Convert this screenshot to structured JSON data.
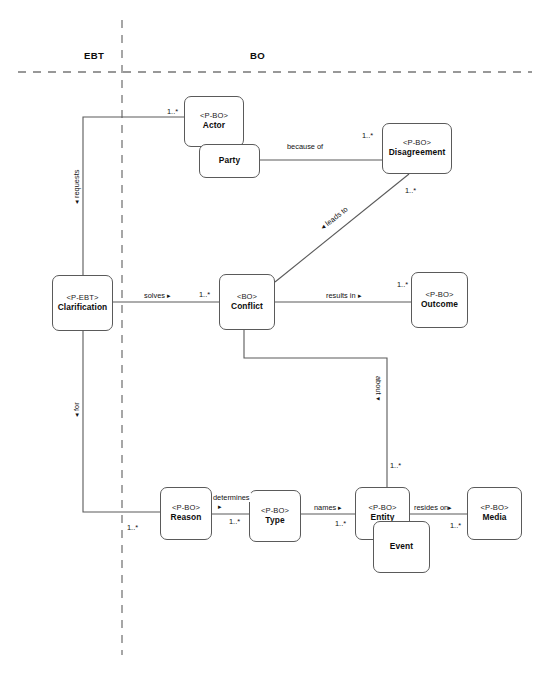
{
  "diagram": {
    "zones": [
      {
        "id": "ebt",
        "label": "EBT",
        "x": 84,
        "y": 50
      },
      {
        "id": "bo",
        "label": "BO",
        "x": 250,
        "y": 50
      }
    ],
    "dividers": [
      {
        "id": "vertical-divider",
        "orientation": "vertical",
        "x": 122,
        "y1": 20,
        "y2": 655
      },
      {
        "id": "horizontal-divider",
        "orientation": "horizontal",
        "y": 72,
        "x1": 18,
        "x2": 532
      }
    ],
    "nodes": [
      {
        "id": "actor",
        "stereotype": "<P-BO>",
        "name": "Actor",
        "x": 184,
        "y": 96,
        "w": 60,
        "h": 51
      },
      {
        "id": "party",
        "stereotype": "",
        "name": "Party",
        "x": 199,
        "y": 144,
        "w": 61,
        "h": 34
      },
      {
        "id": "disagreement",
        "stereotype": "<P-BO>",
        "name": "Disagreement",
        "x": 382,
        "y": 123,
        "w": 70,
        "h": 51
      },
      {
        "id": "clarification",
        "stereotype": "<P-EBT>",
        "name": "Clarification",
        "x": 52,
        "y": 275,
        "w": 61,
        "h": 56
      },
      {
        "id": "conflict",
        "stereotype": "<BO>",
        "name": "Conflict",
        "x": 219,
        "y": 274,
        "w": 56,
        "h": 56
      },
      {
        "id": "outcome",
        "stereotype": "<P-BO>",
        "name": "Outcome",
        "x": 411,
        "y": 272,
        "w": 57,
        "h": 56
      },
      {
        "id": "reason",
        "stereotype": "<P-BO>",
        "name": "Reason",
        "x": 160,
        "y": 487,
        "w": 52,
        "h": 53
      },
      {
        "id": "type",
        "stereotype": "<P-BO>",
        "name": "Type",
        "x": 249,
        "y": 490,
        "w": 52,
        "h": 52
      },
      {
        "id": "entity",
        "stereotype": "<P-BO>",
        "name": "Entity",
        "x": 355,
        "y": 487,
        "w": 55,
        "h": 53
      },
      {
        "id": "event",
        "stereotype": "",
        "name": "Event",
        "x": 373,
        "y": 521,
        "w": 57,
        "h": 52
      },
      {
        "id": "media",
        "stereotype": "<P-BO>",
        "name": "Media",
        "x": 467,
        "y": 487,
        "w": 55,
        "h": 53
      }
    ],
    "edges": [
      {
        "id": "clarification-requests-actor",
        "from": "clarification",
        "to": "actor",
        "path": "M 184 117 L 83 117 L 83 275"
      },
      {
        "id": "actor-because-of-disagreement",
        "from": "party",
        "to": "disagreement",
        "path": "M 260 160 L 382 160"
      },
      {
        "id": "disagreement-leads-to-conflict",
        "from": "disagreement",
        "to": "conflict",
        "path": "M 409 174 L 275 282"
      },
      {
        "id": "clarification-solves-conflict",
        "from": "clarification",
        "to": "conflict",
        "path": "M 113 302 L 219 302"
      },
      {
        "id": "conflict-results-in-outcome",
        "from": "conflict",
        "to": "outcome",
        "path": "M 275 302 L 411 302"
      },
      {
        "id": "conflict-about-entity",
        "from": "conflict",
        "to": "entity",
        "path": "M 244 330 L 244 358 L 387 358 L 387 487"
      },
      {
        "id": "clarification-for-reason",
        "from": "clarification",
        "to": "reason",
        "path": "M 83 331 L 83 512 L 160 512"
      },
      {
        "id": "reason-determines-type",
        "from": "reason",
        "to": "type",
        "path": "M 212 514 L 249 514"
      },
      {
        "id": "type-names-entity",
        "from": "type",
        "to": "entity",
        "path": "M 301 514 L 355 514"
      },
      {
        "id": "entity-resides-on-media",
        "from": "entity",
        "to": "media",
        "path": "M 410 514 L 467 514"
      }
    ],
    "edge_labels": [
      {
        "id": "label-because-of",
        "text": "because of",
        "x": 286,
        "y": 142,
        "orientation": "horizontal"
      },
      {
        "id": "label-results-in",
        "text": "results in ▸",
        "x": 325,
        "y": 291,
        "orientation": "horizontal"
      },
      {
        "id": "label-solves",
        "text": "solves ▸",
        "x": 143,
        "y": 291,
        "orientation": "horizontal"
      },
      {
        "id": "label-determines",
        "text": "determines",
        "x": 212,
        "y": 493,
        "orientation": "horizontal"
      },
      {
        "id": "label-determines-arrow",
        "text": "▸",
        "x": 217,
        "y": 502,
        "orientation": "horizontal"
      },
      {
        "id": "label-names",
        "text": "names ▸",
        "x": 313,
        "y": 503,
        "orientation": "horizontal"
      },
      {
        "id": "label-resides-on",
        "text": "resides on▸",
        "x": 413,
        "y": 503,
        "orientation": "horizontal"
      },
      {
        "id": "label-leads-to",
        "text": "◂ leads to",
        "x": 318,
        "y": 225,
        "orientation": "diagonal",
        "angle": -38
      },
      {
        "id": "label-requests",
        "text": "◂ requests",
        "x": 72,
        "y": 205,
        "orientation": "vertical-up"
      },
      {
        "id": "label-for",
        "text": "◂ for",
        "x": 72,
        "y": 418,
        "orientation": "vertical-up"
      },
      {
        "id": "label-about",
        "text": "about ▾",
        "x": 383,
        "y": 375,
        "orientation": "vertical-down"
      }
    ],
    "multiplicities": [
      {
        "id": "mult-actor",
        "text": "1..*",
        "x": 166,
        "y": 107
      },
      {
        "id": "mult-disagreement",
        "text": "1..*",
        "x": 361,
        "y": 131
      },
      {
        "id": "mult-leads-to",
        "text": "1..*",
        "x": 404,
        "y": 186
      },
      {
        "id": "mult-conflict",
        "text": "1..*",
        "x": 198,
        "y": 290
      },
      {
        "id": "mult-outcome",
        "text": "1..*",
        "x": 396,
        "y": 280
      },
      {
        "id": "mult-reason",
        "text": "1..*",
        "x": 126,
        "y": 523
      },
      {
        "id": "mult-type",
        "text": "1..*",
        "x": 228,
        "y": 517
      },
      {
        "id": "mult-entity",
        "text": "1..*",
        "x": 334,
        "y": 519
      },
      {
        "id": "mult-about",
        "text": "1..*",
        "x": 389,
        "y": 461
      },
      {
        "id": "mult-media",
        "text": "1..*",
        "x": 449,
        "y": 521
      }
    ],
    "style": {
      "line_color": "#5a5a5a",
      "text_color": "#111111",
      "background": "#ffffff",
      "divider_color": "#777777"
    }
  }
}
